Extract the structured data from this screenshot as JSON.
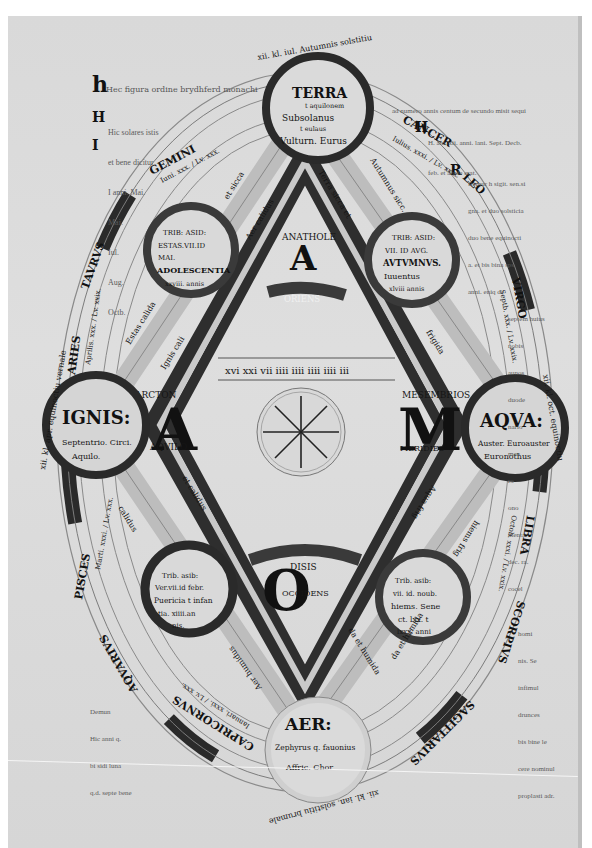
{
  "manuscript": {
    "title_line": "Hec figura ordine brydhferd monachi",
    "top_arc": "xii. kl. iul. Autumnis solstitiu",
    "bottom_arc": "xii. kl. ian. solstitiu brumale",
    "left_arc": "xii. kl. apr. equinoctiu vernale",
    "right_arc": "xii. kl. oct. equinoctiu",
    "elements": {
      "terra": {
        "name": "TERRA",
        "lines": [
          "t aquilonem",
          "Subsolanus",
          "t eulaus",
          "Vulturn. Eurus"
        ]
      },
      "ignis": {
        "name": "IGNIS:",
        "lines": [
          "Septentrio. Circi.",
          "Aquilo."
        ]
      },
      "aqua": {
        "name": "AQVA:",
        "lines": [
          "Auster. Euroauster",
          "Euronothus"
        ]
      },
      "aer": {
        "name": "AER:",
        "lines": [
          "Zephyrus q. fauonius",
          "Affric. Chor."
        ]
      }
    },
    "seasons": {
      "summer": {
        "lines": [
          "TRIB: ASID:",
          "ESTAS.VII.ID",
          "MAI.",
          "ADOLESCENTIA",
          "xxviii. annis"
        ]
      },
      "autumn": {
        "lines": [
          "TRIB: ASID:",
          "VII. ID AVG.",
          "AVTVMNVS.",
          "Iuuentus",
          "xlviii annis"
        ]
      },
      "spring": {
        "lines": [
          "Trib. asib:",
          "Ver.vii.id febr.",
          "Puericia t infan",
          "tia. xiiii.an",
          "nis."
        ]
      },
      "winter": {
        "lines": [
          "Trib. asib:",
          "vii. id. noub.",
          "hiems. Sene",
          "ct. lxx. t",
          "lxxx. anni"
        ]
      }
    },
    "adam": {
      "top": {
        "letter": "A",
        "label_above": "ANATHOLE",
        "label_below": "ORIENS"
      },
      "left": {
        "letter": "A",
        "label_above": "ARCTON",
        "label_below": "AQVILO"
      },
      "right": {
        "letter": "M",
        "label_above": "MESEMBRIOS",
        "label_below": "MERIDIES"
      },
      "bottom": {
        "letter": "O",
        "label_above": "DISIS",
        "label_below": "OCCIDENS"
      }
    },
    "zodiac": [
      {
        "sign": "GEMINI",
        "detail": "Iuni. xxx. / Lv. xxx."
      },
      {
        "sign": "CANCER",
        "detail": "Iulius. xxxi. / Lv. xxix."
      },
      {
        "sign": "LEO",
        "detail": "Augus. xxxi."
      },
      {
        "sign": "VIRGO",
        "detail": "Septb. xxx. / Lv. xxix."
      },
      {
        "sign": "LIBRA",
        "detail": "Octob. xxxi. / Lv. xxix."
      },
      {
        "sign": "SCORPIVS",
        "detail": "Novem. xxx."
      },
      {
        "sign": "SAGITTARIVS",
        "detail": "Decb. xxxi."
      },
      {
        "sign": "CAPRICORNVS",
        "detail": "Ianuari. xxxi. / Lv. xxx."
      },
      {
        "sign": "AQVARIVS",
        "detail": "Febr. xxviii."
      },
      {
        "sign": "PISCES",
        "detail": "Marti. xxxi. / Lv. xxx."
      },
      {
        "sign": "ARIES",
        "detail": "Aprilis. xxx. / Lv. xxix."
      },
      {
        "sign": "TAVRVS",
        "detail": "Maius. xxxi. / Lv. xxx."
      }
    ],
    "qualities": {
      "upper_left_outer": "et sicca",
      "upper_left_inner": "Estas calida",
      "left_inner": "Ignis cali",
      "upper_mid_left": "Aer calidus",
      "upper_mid_right": "Terra sicca et",
      "upper_right_outer": "Autumnus sicc.",
      "right_inner": "frigida",
      "lower_left": "et calidus",
      "lower_left_outer": "calidus",
      "lower_right": "Aqua frig",
      "lower_right_outer": "hiems frig",
      "bottom_left": "Aer humidus",
      "bottom_mid": "da et humida",
      "bottom_right": "da et humida"
    },
    "center_circle_label": "wind rose",
    "numeric_row": "xvi  xxi  vii  iiii iiii iiii iiii iii",
    "marginal_notes": {
      "left_top": [
        "Hic solares istis",
        "et bene dicitur",
        "I anni. Mai.",
        "Mai.",
        "Iul.",
        "Aug.",
        "Octb."
      ],
      "right_top": [
        "ad numero annis centum de secundo misit sequi",
        "H. ani. xii. anni. lani. Sept. Decb.",
        "feb. et alude erat.",
        "Remur h sigit. sen.si",
        "gna. et duo solsticia",
        "duo bene equinocti",
        "a. et bis bina sps",
        "anni. eniq de",
        "septem huius",
        "nobis",
        "aunos",
        "duode",
        "nario",
        "men",
        "ro",
        "ono",
        "menta",
        "dec. ra.",
        "cocel"
      ],
      "right_bottom": [
        "homi",
        "nis. Se",
        "infimul",
        "drunces",
        "bis bine le",
        "cere nominul",
        "proplasti adr."
      ],
      "left_bottom": [
        "Demun",
        "Hic anni q.",
        "bi sidi luna",
        "q.d. septe bene"
      ]
    }
  }
}
